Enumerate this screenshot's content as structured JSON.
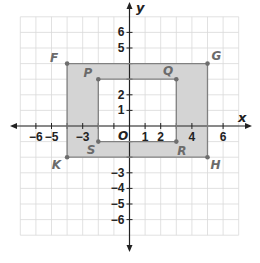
{
  "chart_data": {
    "type": "scatter",
    "title": "",
    "xlabel": "x",
    "ylabel": "y",
    "xlim": [
      -7,
      7
    ],
    "ylim": [
      -7,
      7
    ],
    "grid": true,
    "origin_label": "O",
    "x_tick_labels": [
      {
        "value": -6,
        "label": "−6"
      },
      {
        "value": -5,
        "label": "−5"
      },
      {
        "value": -3,
        "label": "−3"
      },
      {
        "value": 1,
        "label": "1"
      },
      {
        "value": 2,
        "label": "2"
      },
      {
        "value": 4,
        "label": "4"
      },
      {
        "value": 6,
        "label": "6"
      }
    ],
    "y_tick_labels": [
      {
        "value": 6,
        "label": "6"
      },
      {
        "value": 5,
        "label": "5"
      },
      {
        "value": 2,
        "label": "2"
      },
      {
        "value": 1,
        "label": "1"
      },
      {
        "value": -3,
        "label": "−3"
      },
      {
        "value": -4,
        "label": "−4"
      },
      {
        "value": -5,
        "label": "−5"
      },
      {
        "value": -6,
        "label": "−6"
      }
    ],
    "shapes": [
      {
        "name": "outer rectangle FGHK",
        "vertices": [
          {
            "label": "F",
            "x": -4,
            "y": 4
          },
          {
            "label": "G",
            "x": 5,
            "y": 4
          },
          {
            "label": "H",
            "x": 5,
            "y": -2
          },
          {
            "label": "K",
            "x": -4,
            "y": -2
          }
        ]
      },
      {
        "name": "inner rectangle PQRS",
        "vertices": [
          {
            "label": "P",
            "x": -2,
            "y": 3
          },
          {
            "label": "Q",
            "x": 3,
            "y": 3
          },
          {
            "label": "R",
            "x": 3,
            "y": -1
          },
          {
            "label": "S",
            "x": -2,
            "y": -1
          }
        ]
      }
    ],
    "shaded_region": "area between outer rectangle FGHK and inner rectangle PQRS",
    "colors": {
      "grid": "#d9d9d9",
      "axis": "#222222",
      "shape_stroke": "#808080",
      "shade_fill": "#d4d4d4",
      "point": "#6e6e6e",
      "point_label": "#6b6b6b"
    }
  }
}
